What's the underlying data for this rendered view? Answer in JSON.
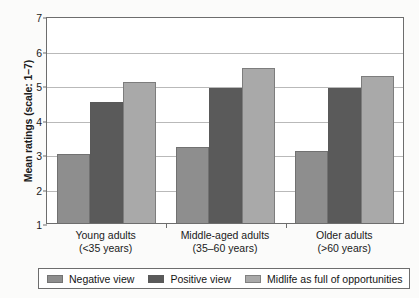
{
  "chart_data": {
    "type": "bar",
    "title": "",
    "xlabel": "",
    "ylabel": "Mean ratings (scale: 1–7)",
    "ylim": [
      1,
      7
    ],
    "yticks": [
      1,
      2,
      3,
      4,
      5,
      6,
      7
    ],
    "grid": true,
    "legend_position": "bottom",
    "categories": [
      "Young adults (<35 years)",
      "Middle-aged adults (35–60 years)",
      "Older adults (>60 years)"
    ],
    "category_lines": [
      {
        "line1": "Young adults",
        "line2": "(<35 years)"
      },
      {
        "line1": "Middle-aged adults",
        "line2": "(35–60 years)"
      },
      {
        "line1": "Older adults",
        "line2": "(>60 years)"
      }
    ],
    "series": [
      {
        "name": "Negative view",
        "color": "#8e8e8e",
        "values": [
          3.0,
          3.2,
          3.1
        ]
      },
      {
        "name": "Positive view",
        "color": "#5a5a5a",
        "values": [
          4.5,
          4.9,
          4.9
        ]
      },
      {
        "name": "Midlife as full of opportunities",
        "color": "#a9a9a9",
        "values": [
          5.1,
          5.5,
          5.25
        ]
      }
    ]
  },
  "legend": {
    "items": [
      {
        "label": "Negative view",
        "color": "#8e8e8e"
      },
      {
        "label": "Positive view",
        "color": "#5a5a5a"
      },
      {
        "label": "Midlife as full of opportunities",
        "color": "#a9a9a9"
      }
    ]
  }
}
